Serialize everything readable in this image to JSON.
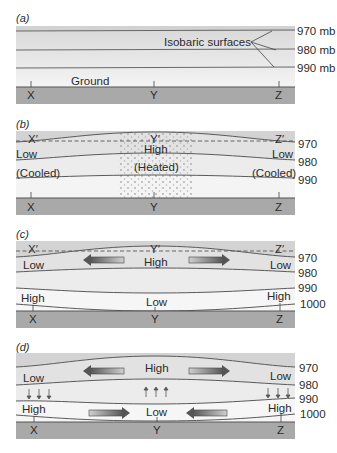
{
  "figure": {
    "panels": [
      {
        "id": "a",
        "label": "(a)",
        "annotation": "Isobaric surfaces",
        "ground_label": "Ground",
        "isobars": [
          "970 mb",
          "980 mb",
          "990 mb"
        ],
        "ground_points": [
          "X",
          "Y",
          "Z"
        ]
      },
      {
        "id": "b",
        "label": "(b)",
        "upper_points": [
          "X′",
          "Y′",
          "Z′"
        ],
        "isobars": [
          "970",
          "980",
          "990"
        ],
        "left_labels": [
          "Low",
          "(Cooled)"
        ],
        "center_labels": [
          "High",
          "(Heated)"
        ],
        "right_labels": [
          "Low",
          "(Cooled)"
        ],
        "ground_points": [
          "X",
          "Y",
          "Z"
        ]
      },
      {
        "id": "c",
        "label": "(c)",
        "upper_points": [
          "X′",
          "Y′",
          "Z′"
        ],
        "isobars": [
          "970",
          "980",
          "990",
          "1000"
        ],
        "upper_labels": [
          "Low",
          "High",
          "Low"
        ],
        "lower_labels": [
          "High",
          "Low",
          "High"
        ],
        "ground_points": [
          "X",
          "Y",
          "Z"
        ]
      },
      {
        "id": "d",
        "label": "(d)",
        "isobars": [
          "970",
          "980",
          "990",
          "1000"
        ],
        "upper_labels": [
          "Low",
          "High",
          "Low"
        ],
        "lower_labels": [
          "High",
          "Low",
          "High"
        ],
        "ground_points": [
          "X",
          "Y",
          "Z"
        ]
      }
    ],
    "colors": {
      "air_dark": "#d6d6d6",
      "air_mid": "#e4e4e4",
      "air_light": "#efefef",
      "air_lightest": "#f6f6f6",
      "ground": "#a9a9a9",
      "line": "#5a5a5a",
      "arrow_dark": "#5e5e5e",
      "arrow_light": "#c8c8c8",
      "dots": "#9a9a9a"
    }
  }
}
